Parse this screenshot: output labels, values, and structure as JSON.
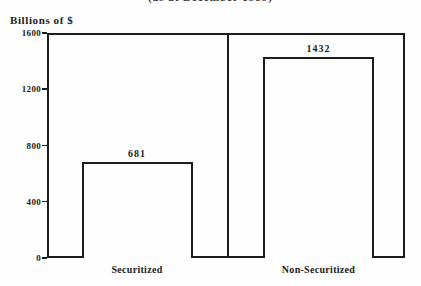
{
  "page": {
    "background": "#fefefe",
    "ink": "#1c1c1c"
  },
  "chart_data": {
    "type": "bar",
    "title": "(as at December 1989)",
    "title_visibility": "clipped-at-top-edge",
    "ylabel": "Billions of $",
    "xlabel": "",
    "categories": [
      "Securitized",
      "Non-Securitized"
    ],
    "values": [
      681,
      1432
    ],
    "value_labels": [
      "681",
      "1432"
    ],
    "ylim": [
      0,
      1600
    ],
    "yticks": [
      0,
      400,
      800,
      1200,
      1600
    ],
    "grid": false,
    "legend": "none",
    "bar_fill": "#fefefe",
    "bar_border": "#1c1c1c",
    "panel_divider": true
  }
}
